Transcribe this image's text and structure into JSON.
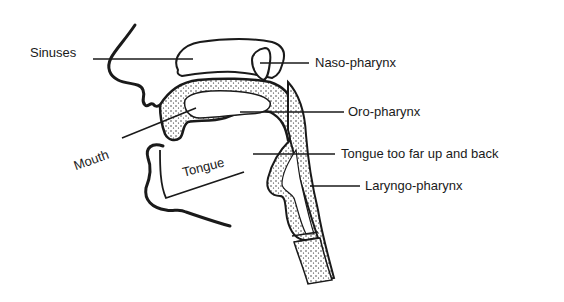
{
  "diagram": {
    "colors": {
      "ink": "#1a1a1a",
      "background": "#ffffff",
      "stipple": "#1a1a1a"
    },
    "labels": {
      "sinuses": "Sinuses",
      "naso_pharynx": "Naso-pharynx",
      "oro_pharynx": "Oro-pharynx",
      "mouth": "Mouth",
      "tongue": "Tongue",
      "tongue_position": "Tongue too far up and back",
      "laryngo_pharynx": "Laryngo-pharynx"
    }
  }
}
